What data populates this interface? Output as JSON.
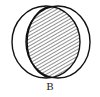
{
  "diagram": {
    "type": "venn",
    "label": "B",
    "sets": [
      {
        "name": "left-set",
        "cx": 46,
        "cy": 42,
        "rx": 34,
        "ry": 36
      },
      {
        "name": "right-set",
        "cx": 58,
        "cy": 42,
        "rx": 32,
        "ry": 36
      }
    ],
    "shaded_region": "intersection",
    "colors": {
      "stroke": "#111111",
      "hatch": "#333333",
      "background": "#ffffff"
    }
  }
}
